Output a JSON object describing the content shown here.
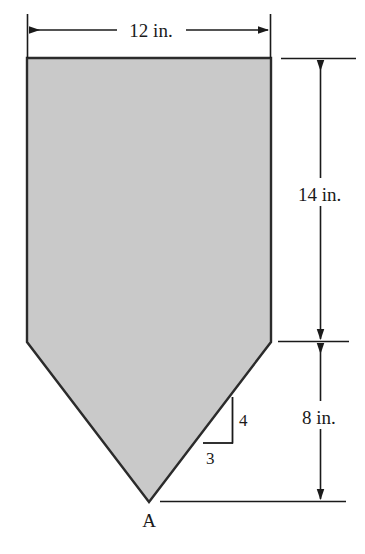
{
  "figure": {
    "shape_name": "pentagon-shield",
    "fill_color": "#c9c9c9",
    "stroke_color": "#2b2b2b",
    "background_color": "#ffffff",
    "apex_label": "A",
    "dimensions": {
      "top_width": "12 in.",
      "upper_height": "14 in.",
      "lower_height": "8 in."
    },
    "slope_triangle": {
      "rise_label": "4",
      "run_label": "3"
    },
    "geometry": {
      "left_x": 27,
      "right_x": 271,
      "top_y": 58,
      "bevel_y": 342,
      "apex_x": 149,
      "apex_y": 502,
      "width_px": 244,
      "upper_height_px": 284,
      "lower_height_px": 160
    }
  }
}
